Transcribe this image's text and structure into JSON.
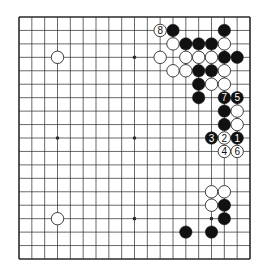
{
  "board": {
    "size": 19,
    "star_points": [
      [
        3,
        3
      ],
      [
        9,
        3
      ],
      [
        15,
        3
      ],
      [
        3,
        9
      ],
      [
        9,
        9
      ],
      [
        15,
        9
      ],
      [
        3,
        15
      ],
      [
        9,
        15
      ],
      [
        15,
        15
      ]
    ],
    "colors": {
      "line": "#2a2a2a",
      "black_stone": "#111111",
      "white_stone": "#ffffff",
      "background": "#ffffff"
    }
  },
  "stones": [
    {
      "color": "black",
      "col": 12,
      "row": 1,
      "label": ""
    },
    {
      "color": "black",
      "col": 16,
      "row": 1,
      "label": ""
    },
    {
      "color": "black",
      "col": 13,
      "row": 2,
      "label": ""
    },
    {
      "color": "black",
      "col": 14,
      "row": 2,
      "label": ""
    },
    {
      "color": "black",
      "col": 15,
      "row": 2,
      "label": ""
    },
    {
      "color": "black",
      "col": 16,
      "row": 3,
      "label": ""
    },
    {
      "color": "black",
      "col": 17,
      "row": 3,
      "label": ""
    },
    {
      "color": "black",
      "col": 14,
      "row": 4,
      "label": ""
    },
    {
      "color": "black",
      "col": 15,
      "row": 4,
      "label": ""
    },
    {
      "color": "black",
      "col": 14,
      "row": 5,
      "label": ""
    },
    {
      "color": "black",
      "col": 14,
      "row": 6,
      "label": ""
    },
    {
      "color": "black",
      "col": 16,
      "row": 6,
      "label": "7"
    },
    {
      "color": "black",
      "col": 17,
      "row": 6,
      "label": "5"
    },
    {
      "color": "black",
      "col": 16,
      "row": 7,
      "label": ""
    },
    {
      "color": "black",
      "col": 16,
      "row": 8,
      "label": ""
    },
    {
      "color": "black",
      "col": 15,
      "row": 9,
      "label": "3"
    },
    {
      "color": "black",
      "col": 17,
      "row": 9,
      "label": "1"
    },
    {
      "color": "black",
      "col": 16,
      "row": 14,
      "label": ""
    },
    {
      "color": "black",
      "col": 16,
      "row": 15,
      "label": ""
    },
    {
      "color": "black",
      "col": 13,
      "row": 16,
      "label": ""
    },
    {
      "color": "black",
      "col": 15,
      "row": 16,
      "label": ""
    },
    {
      "color": "white",
      "col": 11,
      "row": 1,
      "label": "8"
    },
    {
      "color": "white",
      "col": 12,
      "row": 2,
      "label": ""
    },
    {
      "color": "white",
      "col": 16,
      "row": 2,
      "label": ""
    },
    {
      "color": "white",
      "col": 3,
      "row": 3,
      "label": ""
    },
    {
      "color": "white",
      "col": 11,
      "row": 3,
      "label": ""
    },
    {
      "color": "white",
      "col": 13,
      "row": 3,
      "label": ""
    },
    {
      "color": "white",
      "col": 14,
      "row": 3,
      "label": ""
    },
    {
      "color": "white",
      "col": 15,
      "row": 3,
      "label": ""
    },
    {
      "color": "white",
      "col": 12,
      "row": 4,
      "label": ""
    },
    {
      "color": "white",
      "col": 13,
      "row": 4,
      "label": ""
    },
    {
      "color": "white",
      "col": 16,
      "row": 4,
      "label": ""
    },
    {
      "color": "white",
      "col": 15,
      "row": 5,
      "label": ""
    },
    {
      "color": "white",
      "col": 16,
      "row": 5,
      "label": ""
    },
    {
      "color": "white",
      "col": 17,
      "row": 7,
      "label": ""
    },
    {
      "color": "white",
      "col": 17,
      "row": 8,
      "label": ""
    },
    {
      "color": "white",
      "col": 16,
      "row": 9,
      "label": "2"
    },
    {
      "color": "white",
      "col": 16,
      "row": 10,
      "label": "4"
    },
    {
      "color": "white",
      "col": 17,
      "row": 10,
      "label": "6"
    },
    {
      "color": "white",
      "col": 15,
      "row": 13,
      "label": ""
    },
    {
      "color": "white",
      "col": 16,
      "row": 13,
      "label": ""
    },
    {
      "color": "white",
      "col": 15,
      "row": 14,
      "label": ""
    },
    {
      "color": "white",
      "col": 3,
      "row": 15,
      "label": ""
    }
  ]
}
